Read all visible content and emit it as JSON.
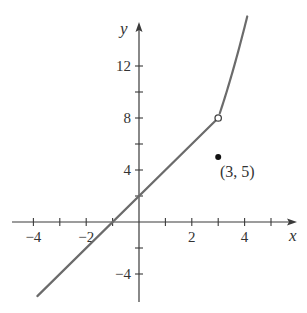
{
  "chart_data": {
    "type": "line",
    "title": "",
    "xlabel": "x",
    "ylabel": "y",
    "xlim": [
      -4.8,
      5.9
    ],
    "ylim": [
      -6.2,
      15.2
    ],
    "grid": false,
    "legend": null,
    "x_ticks": [
      -4,
      -3,
      -2,
      -1,
      1,
      2,
      3,
      4,
      5
    ],
    "x_tick_labels": [
      {
        "value": -4,
        "label": "−4"
      },
      {
        "value": -2,
        "label": "−2"
      },
      {
        "value": 2,
        "label": "2"
      },
      {
        "value": 4,
        "label": "4"
      }
    ],
    "y_ticks": [
      -4,
      -2,
      2,
      4,
      6,
      8,
      10,
      12
    ],
    "y_tick_labels": [
      {
        "value": -4,
        "label": "−4"
      },
      {
        "value": 4,
        "label": "4"
      },
      {
        "value": 8,
        "label": "8"
      },
      {
        "value": 12,
        "label": "12"
      }
    ],
    "series": [
      {
        "name": "linear piece",
        "expression": "y = 2x + 2",
        "domain": [
          -3.85,
          3
        ],
        "x": [
          -3.85,
          -1,
          0,
          3
        ],
        "y": [
          -5.7,
          0,
          2,
          8
        ]
      },
      {
        "name": "quadratic piece",
        "expression": "y = x^2 - 1",
        "domain": [
          3,
          4.1
        ],
        "x": [
          3,
          3.25,
          3.5,
          3.75,
          4.0,
          4.1
        ],
        "y": [
          8,
          9.5625,
          11.25,
          13.0625,
          15,
          15.81
        ]
      }
    ],
    "points": [
      {
        "x": 3,
        "y": 8,
        "style": "open"
      },
      {
        "x": 3,
        "y": 5,
        "style": "filled",
        "label": "(3, 5)"
      }
    ],
    "annotations": [
      {
        "text": "(3, 5)",
        "x": 3,
        "y": 5
      }
    ]
  },
  "labels": {
    "x_axis": "x",
    "y_axis": "y",
    "point_label": "(3, 5)"
  }
}
